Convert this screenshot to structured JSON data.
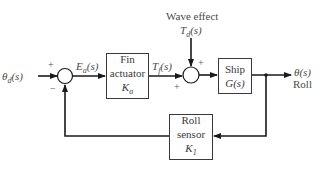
{
  "diagram": {
    "type": "block-diagram",
    "colors": {
      "line": "#1a1a1a",
      "text": "#4a4a4a",
      "box_border": "#3a3a3a"
    },
    "input": {
      "label": "θ",
      "sub": "d",
      "arg": "(s)"
    },
    "summing_junction_1": {
      "plus_sign": "+",
      "minus_sign": "−"
    },
    "error_signal": {
      "label": "E",
      "sub": "a",
      "arg": "(s)"
    },
    "fin_actuator": {
      "line1": "Fin",
      "line2": "actuator",
      "gain": "K",
      "gain_sub": "a"
    },
    "fin_torque": {
      "label": "T",
      "sub": "f",
      "arg": "(s)"
    },
    "disturbance": {
      "title": "Wave effect",
      "label": "T",
      "sub": "d",
      "arg": "(s)"
    },
    "summing_junction_2": {
      "plus_top": "+",
      "plus_left": "+"
    },
    "ship": {
      "line1": "Ship",
      "line2": "G(s)"
    },
    "output": {
      "label": "θ(s)",
      "name": "Roll"
    },
    "roll_sensor": {
      "line1": "Roll",
      "line2": "sensor",
      "gain": "K",
      "gain_sub": "1"
    }
  }
}
